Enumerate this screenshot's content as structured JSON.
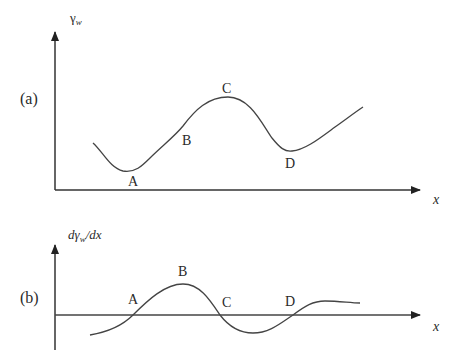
{
  "panel_a": {
    "tag": "(a)",
    "y_label_main": "γ",
    "y_label_sub": "w",
    "x_label": "x",
    "points": {
      "A": "A",
      "B": "B",
      "C": "C",
      "D": "D"
    }
  },
  "panel_b": {
    "tag": "(b)",
    "y_label_prefix": "dγ",
    "y_label_sub": "w",
    "y_label_suffix": "/dx",
    "x_label": "x",
    "points": {
      "A": "A",
      "B": "B",
      "C": "C",
      "D": "D"
    }
  },
  "colors": {
    "line": "#3a3a3a",
    "text": "#2a2a2a",
    "background": "#ffffff"
  }
}
